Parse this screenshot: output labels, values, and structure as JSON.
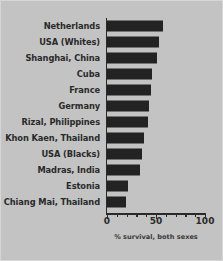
{
  "figure": {
    "background_color": "#c3c3c3",
    "bar_color": "#232323",
    "text_color": "#2a2a2a"
  },
  "axis": {
    "tick_labels": [
      "0",
      "50",
      "100"
    ],
    "tick_values": [
      0,
      50,
      100
    ],
    "minor_tick_values": [
      10,
      20,
      30,
      40,
      60,
      70,
      80,
      90
    ],
    "xlabel": "% survival, both sexes"
  },
  "chart_data": {
    "type": "bar",
    "orientation": "horizontal",
    "title": "",
    "subtitle": "",
    "xlabel": "% survival, both sexes",
    "ylabel": "",
    "xlim": [
      0,
      100
    ],
    "grid": false,
    "legend": null,
    "categories": [
      "Netherlands",
      "USA (Whites)",
      "Shanghai, China",
      "Cuba",
      "France",
      "Germany",
      "Rizal, Philippines",
      "Khon Kaen, Thailand",
      "USA (Blacks)",
      "Madras, India",
      "Estonia",
      "Chiang Mai, Thailand"
    ],
    "values": [
      57,
      53,
      51,
      46,
      45,
      43,
      42,
      38,
      36,
      34,
      21,
      19
    ],
    "series": [
      {
        "name": "% survival, both sexes",
        "values": [
          57,
          53,
          51,
          46,
          45,
          43,
          42,
          38,
          36,
          34,
          21,
          19
        ]
      }
    ]
  }
}
